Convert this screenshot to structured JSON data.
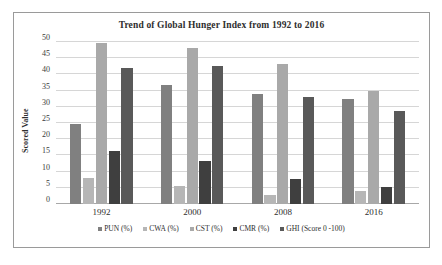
{
  "chart_data": {
    "type": "bar",
    "title": "Trend of Global Hunger Index from 1992 to 2016",
    "xlabel": "",
    "ylabel": "Scored Value",
    "categories": [
      "1992",
      "2000",
      "2008",
      "2016"
    ],
    "ylim": [
      0,
      50
    ],
    "yticks": [
      0,
      5,
      10,
      15,
      20,
      25,
      30,
      35,
      40,
      45,
      50
    ],
    "grid": true,
    "legend_position": "bottom",
    "series": [
      {
        "name": "PUN (%)",
        "color": "#808080",
        "values": [
          24.7,
          36.7,
          34.0,
          32.3
        ]
      },
      {
        "name": "CWA (%)",
        "color": "#b6b6b6",
        "values": [
          8.0,
          5.5,
          2.8,
          3.9
        ]
      },
      {
        "name": "CST (%)",
        "color": "#a9a9a9",
        "values": [
          49.7,
          48.3,
          43.2,
          35.0
        ]
      },
      {
        "name": "CMR (%)",
        "color": "#3f3f3f",
        "values": [
          16.3,
          13.4,
          7.6,
          5.3
        ]
      },
      {
        "name": "GHI (Score 0 -100)",
        "color": "#595959",
        "values": [
          42.1,
          42.5,
          33.1,
          28.7
        ]
      }
    ]
  },
  "frame": {
    "border_color": "#9a9a9a"
  }
}
